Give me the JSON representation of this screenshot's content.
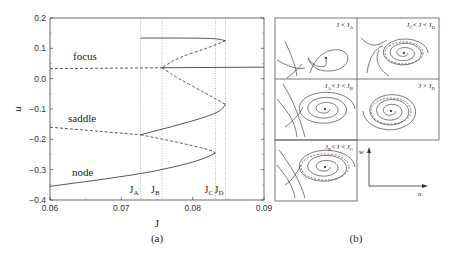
{
  "chart_data": [
    {
      "type": "line",
      "panel_label": "(a)",
      "xlabel": "J",
      "ylabel": "u",
      "xlim": [
        0.06,
        0.09
      ],
      "ylim": [
        -0.4,
        0.2
      ],
      "xticks": [
        "0.06",
        "0.07",
        "0.08",
        "0.09"
      ],
      "yticks": [
        "0.2",
        "0.1",
        "0.0",
        "−0.1",
        "−0.2",
        "−0.3",
        "−0.4"
      ],
      "vertical_markers": [
        {
          "name": "J_A",
          "label": "J",
          "sub": "A",
          "x": 0.0727
        },
        {
          "name": "J_B",
          "label": "J",
          "sub": "B",
          "x": 0.0757
        },
        {
          "name": "J_C",
          "label": "J",
          "sub": "C",
          "x": 0.0832
        },
        {
          "name": "J_D",
          "label": "J",
          "sub": "D",
          "x": 0.0846
        }
      ],
      "annotations": [
        "focus",
        "saddle",
        "node"
      ],
      "series": [
        {
          "name": "focus-unstable-left",
          "style": "dashed",
          "points": [
            [
              0.06,
              0.033
            ],
            [
              0.0757,
              0.036
            ]
          ]
        },
        {
          "name": "focus-stable-right",
          "style": "solid",
          "points": [
            [
              0.0757,
              0.036
            ],
            [
              0.09,
              0.038
            ]
          ]
        },
        {
          "name": "limit-cycle-upper-stable",
          "style": "solid",
          "points": [
            [
              0.0727,
              0.134
            ],
            [
              0.08,
              0.134
            ],
            [
              0.0835,
              0.132
            ],
            [
              0.0846,
              0.125
            ]
          ]
        },
        {
          "name": "limit-cycle-upper-unstable",
          "style": "dashed",
          "points": [
            [
              0.0846,
              0.125
            ],
            [
              0.082,
              0.1
            ],
            [
              0.078,
              0.07
            ],
            [
              0.0757,
              0.036
            ]
          ]
        },
        {
          "name": "saddle-upper-dashed",
          "style": "dashed",
          "points": [
            [
              0.0757,
              0.036
            ],
            [
              0.078,
              0.0
            ],
            [
              0.082,
              -0.05
            ],
            [
              0.0846,
              -0.085
            ]
          ]
        },
        {
          "name": "lower-cycle-stable",
          "style": "solid",
          "points": [
            [
              0.0846,
              -0.085
            ],
            [
              0.0838,
              -0.11
            ],
            [
              0.08,
              -0.14
            ],
            [
              0.0727,
              -0.185
            ]
          ]
        },
        {
          "name": "saddle-left-dashed",
          "style": "dashed",
          "points": [
            [
              0.06,
              -0.16
            ],
            [
              0.0727,
              -0.185
            ]
          ]
        },
        {
          "name": "saddle-lower-dashed",
          "style": "dashed",
          "points": [
            [
              0.0727,
              -0.185
            ],
            [
              0.078,
              -0.21
            ],
            [
              0.0825,
              -0.235
            ],
            [
              0.0832,
              -0.245
            ]
          ]
        },
        {
          "name": "node-stable",
          "style": "solid",
          "points": [
            [
              0.0832,
              -0.245
            ],
            [
              0.081,
              -0.27
            ],
            [
              0.075,
              -0.305
            ],
            [
              0.068,
              -0.33
            ],
            [
              0.06,
              -0.355
            ]
          ]
        }
      ]
    }
  ],
  "panel_b": {
    "label": "(b)",
    "panels": [
      {
        "id": "p1",
        "cond": "J < J",
        "sub": "A"
      },
      {
        "id": "p2",
        "cond_pre": "J",
        "pre_sub": "C",
        "cond": "< J < J",
        "sub": "D"
      },
      {
        "id": "p3",
        "cond_pre": "J",
        "pre_sub": "A",
        "cond": "< J < J",
        "sub": "B"
      },
      {
        "id": "p4",
        "cond": "J > J",
        "sub": "D"
      },
      {
        "id": "p5",
        "cond_pre": "J",
        "pre_sub": "B",
        "cond": "< J < J",
        "sub": "C"
      }
    ],
    "axes": {
      "x": "u",
      "y": "w"
    }
  }
}
